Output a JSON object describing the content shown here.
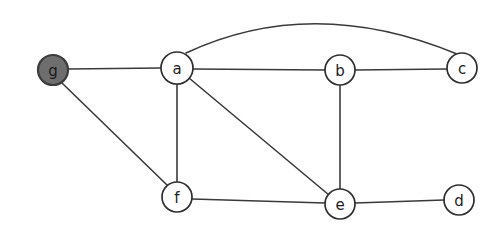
{
  "figure": {
    "kind": "undirected-graph-diagram",
    "width": 504,
    "height": 237,
    "background_color": "#ffffff"
  },
  "style": {
    "edge_color": "#3a3a3a",
    "edge_width": 1.6,
    "node_stroke_color": "#2e2e2e",
    "node_fill_default": "#ffffff",
    "node_fill_highlight": "#6e6e6e",
    "label_color": "#1e1e1e"
  },
  "nodes": [
    {
      "id": "g",
      "label": "g",
      "cx": 53,
      "cy": 70,
      "r": 15,
      "fill": "#6e6e6e",
      "highlighted": true
    },
    {
      "id": "a",
      "label": "a",
      "cx": 177,
      "cy": 68,
      "r": 16,
      "fill": "#ffffff",
      "highlighted": false
    },
    {
      "id": "b",
      "label": "b",
      "cx": 340,
      "cy": 70,
      "r": 15,
      "fill": "#ffffff",
      "highlighted": false
    },
    {
      "id": "c",
      "label": "c",
      "cx": 462,
      "cy": 68,
      "r": 15,
      "fill": "#ffffff",
      "highlighted": false
    },
    {
      "id": "f",
      "label": "f",
      "cx": 177,
      "cy": 197,
      "r": 15,
      "fill": "#ffffff",
      "highlighted": false
    },
    {
      "id": "e",
      "label": "e",
      "cx": 340,
      "cy": 204,
      "r": 15,
      "fill": "#ffffff",
      "highlighted": false
    },
    {
      "id": "d",
      "label": "d",
      "cx": 459,
      "cy": 200,
      "r": 15,
      "fill": "#ffffff",
      "highlighted": false
    }
  ],
  "edges": [
    {
      "id": "g-a",
      "source": "g",
      "target": "a",
      "shape": "straight",
      "path": "M 68 69 L 161 68"
    },
    {
      "id": "g-f",
      "source": "g",
      "target": "f",
      "shape": "straight",
      "path": "M 62 83 L 167 185"
    },
    {
      "id": "a-b",
      "source": "a",
      "target": "b",
      "shape": "straight",
      "path": "M 193 69 L 325 70"
    },
    {
      "id": "a-c",
      "source": "a",
      "target": "c",
      "shape": "curved",
      "path": "M 186 53 Q 312 -6 457 54"
    },
    {
      "id": "a-f",
      "source": "a",
      "target": "f",
      "shape": "straight",
      "path": "M 177 84 L 177 182"
    },
    {
      "id": "a-e",
      "source": "a",
      "target": "e",
      "shape": "straight",
      "path": "M 189 78 L 329 195"
    },
    {
      "id": "b-c",
      "source": "b",
      "target": "c",
      "shape": "straight",
      "path": "M 355 70 L 447 69"
    },
    {
      "id": "b-e",
      "source": "b",
      "target": "e",
      "shape": "straight",
      "path": "M 340 85 L 340 189"
    },
    {
      "id": "f-e",
      "source": "f",
      "target": "e",
      "shape": "straight",
      "path": "M 192 199 L 325 203"
    },
    {
      "id": "e-d",
      "source": "e",
      "target": "d",
      "shape": "straight",
      "path": "M 355 203 L 444 200"
    }
  ]
}
